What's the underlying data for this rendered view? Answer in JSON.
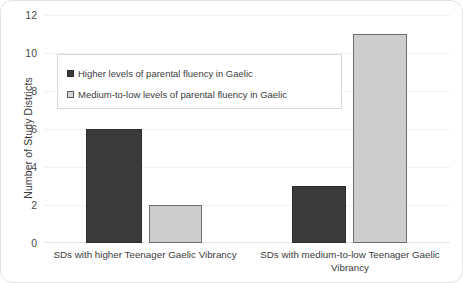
{
  "chart_data": {
    "type": "bar",
    "title": "",
    "xlabel": "",
    "ylabel": "Number of Study Districts",
    "ylim": [
      0,
      12
    ],
    "yticks": [
      12,
      10,
      8,
      6,
      4,
      2,
      0
    ],
    "grid": true,
    "legend_position": "upper-left-inside",
    "categories": [
      "SDs with higher Teenager Gaelic Vibrancy",
      "SDs with medium-to-low Teenager  Gaelic Vibrancy"
    ],
    "series": [
      {
        "name": "Higher levels of parental fluency in Gaelic",
        "values": [
          6,
          3
        ],
        "color": "#3a3a3a"
      },
      {
        "name": "Medium-to-low levels of parental fluency in Gaelic",
        "values": [
          2,
          11
        ],
        "color": "#cdcdcd"
      }
    ]
  },
  "colors": {
    "series_dark": "#3a3a3a",
    "series_light": "#cdcdcd",
    "gridline": "#f1f1f1",
    "text": "#3b3b3b",
    "frame_border": "#e3e3e3",
    "legend_border": "#d9d9d9"
  }
}
